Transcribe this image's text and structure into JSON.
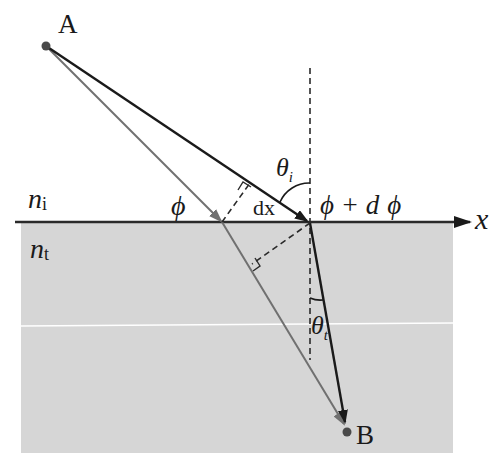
{
  "diagram": {
    "media": {
      "incident": {
        "label": "n",
        "subscript": "i"
      },
      "transmitted": {
        "label": "n",
        "subscript": "t",
        "fill_color": "#d6d6d6"
      }
    },
    "points": {
      "A": {
        "label": "A",
        "x": 46,
        "y": 46
      },
      "B": {
        "label": "B",
        "x": 347,
        "y": 432
      }
    },
    "axis": {
      "label": "x"
    },
    "phase_labels": {
      "left": "ϕ",
      "right_prefix": "ϕ + d",
      "right_symbol": "ϕ"
    },
    "segment_label": "dx",
    "angles": {
      "incident": {
        "symbol": "θ",
        "subscript": "i"
      },
      "transmitted": {
        "symbol": "θ",
        "subscript": "t"
      }
    },
    "colors": {
      "primary_ray": "#1a1a1a",
      "secondary_ray": "#707070",
      "interface": "#2a2a2a",
      "transmitted_medium": "#d6d6d6",
      "dashed": "#2a2a2a"
    }
  }
}
